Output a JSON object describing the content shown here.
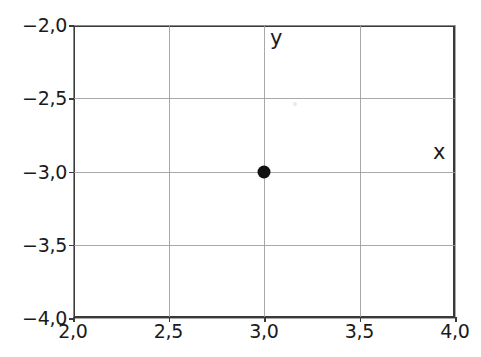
{
  "chart_data": {
    "type": "scatter",
    "title": "",
    "subtitle": "",
    "xlabel": "x",
    "ylabel": "y",
    "xlim": [
      2.0,
      4.0
    ],
    "ylim": [
      -4.0,
      -2.0
    ],
    "grid": true,
    "legend": null,
    "decimal_separator": ",",
    "x_ticks": [
      2.0,
      2.5,
      3.0,
      3.5,
      4.0
    ],
    "y_ticks": [
      -4.0,
      -3.5,
      -3.0,
      -2.5,
      -2.0
    ],
    "x_tick_labels": [
      "2,0",
      "2,5",
      "3,0",
      "3,5",
      "4,0"
    ],
    "y_tick_labels": [
      "-4,0",
      "-3,5",
      "-3,0",
      "-2,5",
      "-2,0"
    ],
    "series": [
      {
        "name": "point",
        "marker": "filled-circle",
        "color": "#111111",
        "points": [
          {
            "x": 3.0,
            "y": -3.0,
            "label": "(3,0 | -3,0)"
          }
        ]
      }
    ]
  },
  "axis_names": {
    "y_axis_name": "y",
    "x_axis_name": "x"
  },
  "colors": {
    "background": "#ffffff",
    "gridline": "#9a9a9a",
    "spine": "#3a3a3a",
    "marker": "#111111",
    "text": "#1a1a1a"
  }
}
